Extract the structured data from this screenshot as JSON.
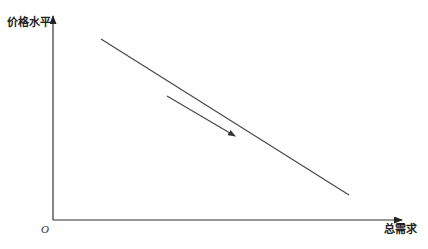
{
  "diagram": {
    "type": "economics-curve",
    "y_axis": {
      "label": "价格水平"
    },
    "x_axis": {
      "label": "总需求"
    },
    "origin_label": "O",
    "curve": {
      "description": "downward-sloping straight line",
      "from": [
        101,
        39
      ],
      "to": [
        349,
        195
      ]
    },
    "movement_arrow": {
      "description": "arrow parallel to the curve pointing down-right",
      "from": [
        167,
        96
      ],
      "to": [
        235,
        136
      ]
    },
    "colors": {
      "line": "#444444",
      "axis": "#333333",
      "text": "#222222"
    }
  }
}
